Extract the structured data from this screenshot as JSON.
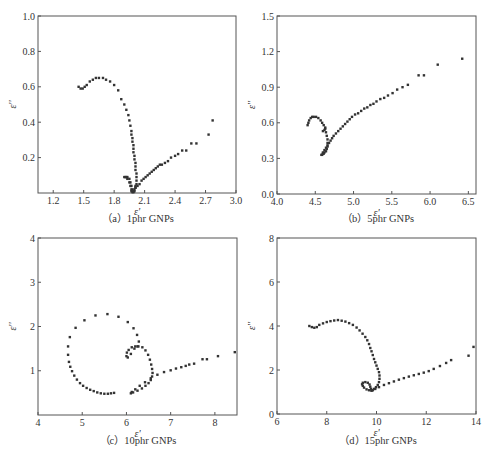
{
  "figure": {
    "panels_caption_prefix": ""
  },
  "chart_data": [
    {
      "type": "scatter",
      "id": "a",
      "title": "（a）1phr GNPs",
      "xlabel": "ε'",
      "ylabel": "ε''",
      "xlim": [
        1.05,
        3.0
      ],
      "ylim": [
        0,
        1.0
      ],
      "xticks": [
        1.2,
        1.5,
        1.8,
        2.1,
        2.4,
        2.7,
        3.0
      ],
      "xtick_labels": [
        "1.2",
        "1.5",
        "1.8",
        "2.1",
        "2.4",
        "2.7",
        "3.0"
      ],
      "yticks": [
        0.2,
        0.4,
        0.6,
        0.8,
        1.0
      ],
      "ytick_labels": [
        "0.2",
        "0.4",
        "0.6",
        "0.8",
        "1.0"
      ],
      "frame": {
        "x0": 38,
        "x1": 236,
        "y0": 16,
        "y1": 193
      },
      "caption_pos": {
        "x": 138,
        "y": 222
      },
      "x": [
        1.45,
        1.47,
        1.49,
        1.51,
        1.53,
        1.56,
        1.59,
        1.62,
        1.65,
        1.69,
        1.72,
        1.76,
        1.8,
        1.84,
        1.87,
        1.9,
        1.92,
        1.94,
        1.95,
        1.96,
        1.97,
        1.97,
        1.98,
        1.98,
        1.99,
        1.99,
        1.99,
        2.0,
        2.0,
        2.01,
        2.01,
        2.01,
        2.02,
        2.02,
        2.02,
        2.02,
        2.01,
        2.01,
        2.0,
        2.0,
        1.99,
        1.98,
        1.97,
        1.96,
        1.95,
        1.93,
        1.92,
        1.9,
        1.91,
        1.93,
        1.95,
        1.96,
        1.97,
        1.97,
        1.98,
        1.99,
        2.01,
        2.03,
        2.05,
        2.07,
        2.09,
        2.11,
        2.13,
        2.15,
        2.17,
        2.19,
        2.21,
        2.23,
        2.25,
        2.27,
        2.3,
        2.33,
        2.36,
        2.4,
        2.43,
        2.47,
        2.51,
        2.56,
        2.61,
        2.73,
        2.77
      ],
      "y": [
        0.6,
        0.59,
        0.59,
        0.6,
        0.61,
        0.63,
        0.64,
        0.65,
        0.65,
        0.65,
        0.64,
        0.63,
        0.61,
        0.58,
        0.53,
        0.5,
        0.47,
        0.44,
        0.41,
        0.38,
        0.35,
        0.33,
        0.31,
        0.29,
        0.27,
        0.25,
        0.23,
        0.21,
        0.19,
        0.17,
        0.15,
        0.13,
        0.11,
        0.09,
        0.07,
        0.05,
        0.04,
        0.03,
        0.02,
        0.01,
        0.005,
        0.02,
        0.04,
        0.06,
        0.08,
        0.09,
        0.09,
        0.09,
        0.09,
        0.08,
        0.06,
        0.04,
        0.02,
        0.01,
        0.005,
        0.01,
        0.03,
        0.04,
        0.05,
        0.07,
        0.08,
        0.09,
        0.1,
        0.11,
        0.12,
        0.13,
        0.14,
        0.15,
        0.16,
        0.16,
        0.17,
        0.18,
        0.2,
        0.21,
        0.22,
        0.24,
        0.24,
        0.28,
        0.28,
        0.33,
        0.41
      ]
    },
    {
      "type": "scatter",
      "id": "b",
      "title": "（b）5phr GNPs",
      "xlabel": "ε'",
      "ylabel": "ε''",
      "xlim": [
        4.0,
        6.6
      ],
      "ylim": [
        0.0,
        1.5
      ],
      "xticks": [
        4.0,
        4.5,
        5.0,
        5.5,
        6.0,
        6.5
      ],
      "xtick_labels": [
        "4.0",
        "4.5",
        "5.0",
        "5.5",
        "6.0",
        "6.5"
      ],
      "yticks": [
        0.0,
        0.3,
        0.6,
        0.9,
        1.2,
        1.5
      ],
      "ytick_labels": [
        "0.0",
        "0.3",
        "0.6",
        "0.9",
        "1.2",
        "1.5"
      ],
      "frame": {
        "x0": 277,
        "x1": 476,
        "y0": 16,
        "y1": 194
      },
      "caption_pos": {
        "x": 378,
        "y": 222
      },
      "x": [
        4.4,
        4.41,
        4.42,
        4.44,
        4.46,
        4.48,
        4.51,
        4.54,
        4.57,
        4.59,
        4.61,
        4.63,
        4.64,
        4.65,
        4.66,
        4.66,
        4.66,
        4.65,
        4.64,
        4.62,
        4.61,
        4.6,
        4.59,
        4.58,
        4.6,
        4.62,
        4.64,
        4.66,
        4.68,
        4.7,
        4.72,
        4.74,
        4.77,
        4.8,
        4.83,
        4.86,
        4.89,
        4.92,
        4.95,
        4.98,
        5.02,
        5.06,
        5.1,
        5.14,
        5.18,
        5.22,
        5.26,
        5.3,
        5.35,
        5.4,
        5.45,
        5.51,
        5.57,
        5.64,
        5.71,
        5.85,
        5.92,
        6.1,
        6.42,
        4.6,
        4.62,
        4.63
      ],
      "y": [
        0.58,
        0.6,
        0.62,
        0.64,
        0.65,
        0.65,
        0.65,
        0.64,
        0.62,
        0.6,
        0.58,
        0.55,
        0.52,
        0.49,
        0.46,
        0.43,
        0.4,
        0.38,
        0.36,
        0.35,
        0.34,
        0.34,
        0.33,
        0.33,
        0.35,
        0.37,
        0.39,
        0.41,
        0.43,
        0.45,
        0.47,
        0.49,
        0.51,
        0.53,
        0.55,
        0.57,
        0.59,
        0.61,
        0.63,
        0.65,
        0.67,
        0.68,
        0.7,
        0.72,
        0.73,
        0.75,
        0.76,
        0.78,
        0.8,
        0.81,
        0.83,
        0.85,
        0.88,
        0.9,
        0.92,
        1.0,
        1.0,
        1.09,
        1.14,
        0.53,
        0.54,
        0.56
      ]
    },
    {
      "type": "scatter",
      "id": "c",
      "title": "（c）10phr GNPs",
      "xlabel": "ε'",
      "ylabel": "ε''",
      "xlim": [
        4.0,
        8.5
      ],
      "ylim": [
        0,
        4
      ],
      "xticks": [
        4,
        5,
        6,
        7,
        8
      ],
      "xtick_labels": [
        "4",
        "5",
        "6",
        "7",
        "8"
      ],
      "yticks": [
        1,
        2,
        3,
        4
      ],
      "ytick_labels": [
        "1",
        "2",
        "3",
        "4"
      ],
      "frame": {
        "x0": 38,
        "x1": 237,
        "y0": 238,
        "y1": 415
      },
      "caption_pos": {
        "x": 138,
        "y": 444
      },
      "x": [
        5.72,
        5.65,
        5.58,
        5.5,
        5.42,
        5.34,
        5.26,
        5.18,
        5.1,
        5.02,
        4.95,
        4.88,
        4.82,
        4.77,
        4.73,
        4.7,
        4.68,
        4.68,
        4.72,
        4.85,
        5.05,
        5.3,
        5.57,
        5.82,
        6.03,
        6.16,
        6.24,
        6.28,
        6.25,
        6.2,
        6.12,
        6.05,
        6.01,
        6.0,
        6.03,
        6.1,
        6.18,
        6.27,
        6.36,
        6.43,
        6.49,
        6.53,
        6.56,
        6.58,
        6.59,
        6.58,
        6.55,
        6.5,
        6.43,
        6.35,
        6.25,
        6.15,
        6.1,
        6.12,
        6.2,
        6.3,
        6.42,
        6.55,
        6.7,
        6.85,
        7.0,
        7.12,
        7.24,
        7.34,
        7.42,
        7.53,
        7.72,
        7.82,
        8.07,
        8.45
      ],
      "y": [
        0.5,
        0.49,
        0.48,
        0.48,
        0.49,
        0.51,
        0.54,
        0.57,
        0.61,
        0.66,
        0.72,
        0.8,
        0.89,
        0.99,
        1.09,
        1.2,
        1.36,
        1.55,
        1.76,
        1.97,
        2.14,
        2.25,
        2.28,
        2.22,
        2.1,
        1.96,
        1.81,
        1.66,
        1.55,
        1.55,
        1.53,
        1.47,
        1.41,
        1.33,
        1.3,
        1.38,
        1.5,
        1.55,
        1.53,
        1.46,
        1.36,
        1.25,
        1.14,
        1.04,
        0.95,
        0.87,
        0.79,
        0.72,
        0.66,
        0.6,
        0.55,
        0.51,
        0.49,
        0.52,
        0.58,
        0.66,
        0.74,
        0.83,
        0.91,
        0.97,
        1.01,
        1.05,
        1.08,
        1.11,
        1.14,
        1.16,
        1.26,
        1.26,
        1.33,
        1.42
      ]
    },
    {
      "type": "scatter",
      "id": "d",
      "title": "（d）15phr GNPs",
      "xlabel": "ε'",
      "ylabel": "ε''",
      "xlim": [
        6,
        14
      ],
      "ylim": [
        0,
        8
      ],
      "xticks": [
        6,
        8,
        10,
        12,
        14
      ],
      "xtick_labels": [
        "6",
        "8",
        "10",
        "12",
        "14"
      ],
      "yticks": [
        0,
        2,
        4,
        6,
        8
      ],
      "ytick_labels": [
        "0",
        "2",
        "4",
        "6",
        "8"
      ],
      "frame": {
        "x0": 277,
        "x1": 476,
        "y0": 238,
        "y1": 414
      },
      "caption_pos": {
        "x": 378,
        "y": 444
      },
      "x": [
        7.3,
        7.4,
        7.5,
        7.6,
        7.7,
        7.85,
        8.0,
        8.15,
        8.3,
        8.45,
        8.6,
        8.75,
        8.9,
        9.05,
        9.2,
        9.32,
        9.44,
        9.55,
        9.63,
        9.7,
        9.75,
        9.8,
        9.85,
        9.9,
        9.95,
        10.0,
        10.05,
        10.1,
        10.12,
        10.12,
        10.1,
        10.05,
        9.98,
        9.9,
        9.8,
        9.7,
        9.6,
        9.5,
        9.45,
        9.42,
        9.45,
        9.55,
        9.65,
        9.72,
        9.75,
        9.78,
        9.8,
        9.85,
        9.95,
        10.1,
        10.3,
        10.5,
        10.7,
        10.9,
        11.1,
        11.3,
        11.5,
        11.7,
        11.9,
        12.1,
        12.3,
        12.55,
        12.8,
        13.0,
        13.7,
        13.9
      ],
      "y": [
        4.0,
        3.95,
        3.92,
        3.95,
        4.05,
        4.12,
        4.18,
        4.22,
        4.25,
        4.27,
        4.24,
        4.2,
        4.13,
        4.05,
        3.93,
        3.8,
        3.65,
        3.5,
        3.35,
        3.18,
        3.0,
        2.85,
        2.68,
        2.5,
        2.35,
        2.2,
        2.05,
        1.9,
        1.75,
        1.6,
        1.45,
        1.32,
        1.22,
        1.14,
        1.08,
        1.08,
        1.12,
        1.2,
        1.28,
        1.35,
        1.42,
        1.45,
        1.42,
        1.34,
        1.24,
        1.14,
        1.06,
        1.08,
        1.14,
        1.22,
        1.32,
        1.4,
        1.48,
        1.56,
        1.63,
        1.7,
        1.76,
        1.82,
        1.88,
        1.95,
        2.05,
        2.18,
        2.32,
        2.45,
        2.65,
        3.05
      ]
    }
  ]
}
